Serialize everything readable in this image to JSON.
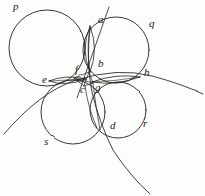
{
  "figure": {
    "type": "geometric-diagram",
    "style": "hand-drawn ink sketch on aged paper",
    "ink_color": "#23211e",
    "paper_color": "#fdfdfb"
  },
  "point_labels": [
    {
      "id": "a",
      "text": "a",
      "x": 98,
      "y": 19
    },
    {
      "id": "b",
      "text": "b",
      "x": 98,
      "y": 63
    },
    {
      "id": "c",
      "text": "c",
      "x": 81,
      "y": 88
    },
    {
      "id": "d",
      "text": "d",
      "x": 110,
      "y": 125
    },
    {
      "id": "e",
      "text": "e",
      "x": 42,
      "y": 79
    },
    {
      "id": "f",
      "text": "f",
      "x": 75,
      "y": 69
    },
    {
      "id": "g",
      "text": "g",
      "x": 96,
      "y": 86
    },
    {
      "id": "h",
      "text": "h",
      "x": 144,
      "y": 72
    }
  ],
  "curve_labels": [
    {
      "id": "p",
      "text": "p",
      "x": 13,
      "y": 4
    },
    {
      "id": "q",
      "text": "q",
      "x": 149,
      "y": 22
    },
    {
      "id": "r",
      "text": "r",
      "x": 143,
      "y": 122
    },
    {
      "id": "s",
      "text": "s",
      "x": 44,
      "y": 140
    }
  ],
  "circles": [
    {
      "name": "p",
      "cx": 47,
      "cy": 48,
      "r": 38
    },
    {
      "name": "q",
      "cx": 116,
      "cy": 50,
      "r": 33
    },
    {
      "name": "s",
      "cx": 73,
      "cy": 112,
      "r": 32
    },
    {
      "name": "r",
      "cx": 118,
      "cy": 110,
      "r": 28
    },
    {
      "name": "lens-ab-left",
      "cx": 87,
      "cy": 49,
      "r": 24
    },
    {
      "name": "lens-ab-right",
      "cx": 95,
      "cy": 49,
      "r": 24
    },
    {
      "name": "lens-ef-upper",
      "cx": 65,
      "cy": 74,
      "r": 24
    },
    {
      "name": "lens-ef-lower",
      "cx": 65,
      "cy": 84,
      "r": 24
    },
    {
      "name": "lens-gh-upper",
      "cx": 118,
      "cy": 74,
      "r": 24
    },
    {
      "name": "lens-gh-lower",
      "cx": 118,
      "cy": 84,
      "r": 24
    }
  ],
  "arcs": [
    {
      "name": "arc-through-e-and-h",
      "from_x": 4,
      "from_y": 134,
      "to_x": 203,
      "to_y": 94
    },
    {
      "name": "arc-from-d-descending",
      "from_x": 90,
      "from_y": 28,
      "to_x": 150,
      "to_y": 194
    }
  ],
  "lines": [
    {
      "name": "secant-through-a",
      "x1": 108,
      "y1": 8,
      "x2": 78,
      "y2": 96
    }
  ]
}
